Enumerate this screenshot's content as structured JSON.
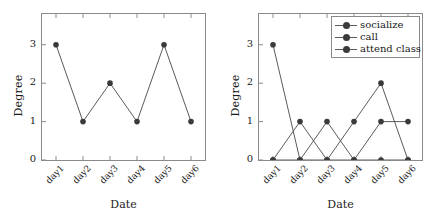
{
  "figure": {
    "background": "#ffffff",
    "line_color": "#5a5a5a",
    "marker_color": "#3a3a3a",
    "frame_color": "#8a8a8a"
  },
  "panels": [
    {
      "id": "left",
      "xlabel": "Date",
      "ylabel": "Degree",
      "yticks": [
        "0",
        "1",
        "2",
        "3"
      ],
      "xticks": [
        "day1",
        "day2",
        "day3",
        "day4",
        "day5",
        "day6"
      ]
    },
    {
      "id": "right",
      "xlabel": "Date",
      "ylabel": "Degree",
      "yticks": [
        "0",
        "1",
        "2",
        "3"
      ],
      "xticks": [
        "day1",
        "day2",
        "day3",
        "day4",
        "day5",
        "day6"
      ],
      "legend": [
        {
          "label": "socialize"
        },
        {
          "label": "call"
        },
        {
          "label": "attend class"
        }
      ]
    }
  ],
  "chart_data": [
    {
      "type": "line",
      "title": "",
      "xlabel": "Date",
      "ylabel": "Degree",
      "categories": [
        "day1",
        "day2",
        "day3",
        "day4",
        "day5",
        "day6"
      ],
      "values": [
        3,
        1,
        2,
        1,
        3,
        1
      ],
      "ylim": [
        0,
        3.8
      ],
      "ytick_values": [
        0,
        1,
        2,
        3
      ],
      "grid": false,
      "legend": "none",
      "marker": "circle"
    },
    {
      "type": "line",
      "title": "",
      "xlabel": "Date",
      "ylabel": "Degree",
      "categories": [
        "day1",
        "day2",
        "day3",
        "day4",
        "day5",
        "day6"
      ],
      "series": [
        {
          "name": "socialize",
          "values": [
            3,
            0,
            0,
            0,
            0,
            0
          ]
        },
        {
          "name": "call",
          "values": [
            0,
            1,
            0,
            1,
            2,
            0
          ]
        },
        {
          "name": "attend class",
          "values": [
            0,
            0,
            1,
            0,
            1,
            1
          ]
        }
      ],
      "ylim": [
        0,
        3.8
      ],
      "ytick_values": [
        0,
        1,
        2,
        3
      ],
      "grid": false,
      "legend": "upper right",
      "marker": "circle"
    }
  ]
}
